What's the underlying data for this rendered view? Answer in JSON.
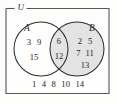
{
  "diagram": {
    "title_label": "U",
    "sets": [
      {
        "key": "A",
        "label": "A",
        "fill": "#ffffff"
      },
      {
        "key": "B",
        "label": "B",
        "fill": "#e3e3e3"
      }
    ],
    "stroke_color": "#2b2b2b",
    "border_color": "#555555",
    "background": "#fdfdfc"
  },
  "regions": {
    "a_only": {
      "name": "A only",
      "rows": [
        [
          "3",
          "9"
        ],
        [
          "15"
        ]
      ]
    },
    "intersection": {
      "name": "A and B",
      "rows": [
        [
          "6"
        ],
        [
          "12"
        ]
      ]
    },
    "b_only": {
      "name": "B only",
      "rows": [
        [
          "2",
          "5"
        ],
        [
          "7",
          "11"
        ],
        [
          "13"
        ]
      ]
    },
    "outside": {
      "name": "outside A and B",
      "rows": [
        [
          "1",
          "4",
          "8",
          "10",
          "14"
        ]
      ]
    }
  }
}
